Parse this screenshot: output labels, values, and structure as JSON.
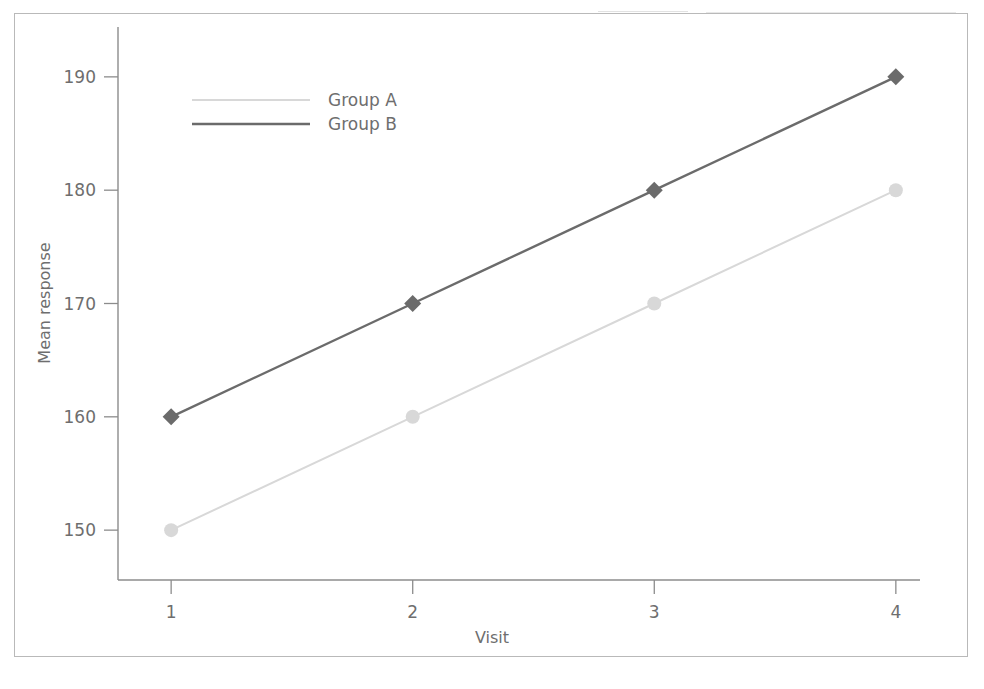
{
  "chart_data": {
    "type": "line",
    "title": "",
    "xlabel": "Visit",
    "ylabel": "Mean response",
    "categories": [
      "1",
      "2",
      "3",
      "4"
    ],
    "x": [
      1,
      2,
      3,
      4
    ],
    "xlim": [
      0.78,
      4.1
    ],
    "ylim": [
      145.6,
      194.4
    ],
    "yticks": [
      150,
      160,
      170,
      180,
      190
    ],
    "ytick_labels": [
      "150",
      "160",
      "170",
      "180",
      "190"
    ],
    "xticks": [
      1,
      2,
      3,
      4
    ],
    "xtick_labels": [
      "1",
      "2",
      "3",
      "4"
    ],
    "grid": false,
    "legend_position": "upper left inside",
    "series": [
      {
        "name": "Group A",
        "values": [
          150,
          160,
          170,
          180
        ],
        "color": "#d8d8d8",
        "marker": "circle",
        "line_width": 2.0
      },
      {
        "name": "Group B",
        "values": [
          160,
          170,
          180,
          190
        ],
        "color": "#6b6b6b",
        "marker": "diamond",
        "line_width": 2.4
      }
    ]
  },
  "legend": {
    "items": [
      {
        "label": "Group A",
        "color": "#d8d8d8"
      },
      {
        "label": "Group B",
        "color": "#6b6b6b"
      }
    ]
  },
  "axes": {
    "x_title": "Visit",
    "y_title": "Mean response",
    "axis_color": "#8c8c8c",
    "tick_text_color": "#6e6e6e"
  },
  "figure": {
    "border_color": "#b9b9b9",
    "background": "#ffffff"
  }
}
